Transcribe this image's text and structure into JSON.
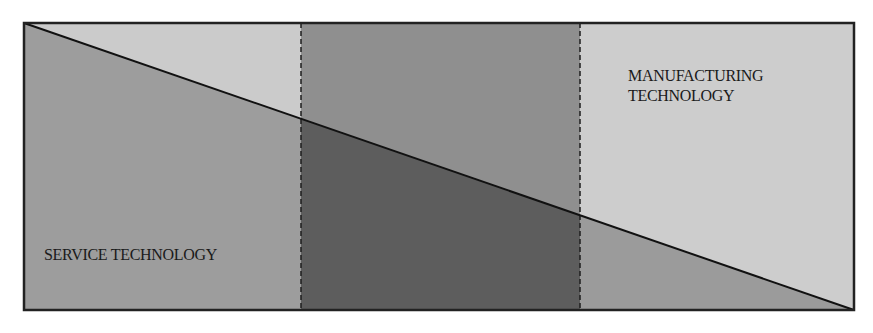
{
  "diagram": {
    "box": {
      "x1": 24,
      "y1": 23,
      "x2": 854,
      "y2": 310
    },
    "dividers_x": [
      301,
      580
    ],
    "diagonal": {
      "from": [
        24,
        23
      ],
      "to": [
        854,
        310
      ]
    },
    "colors": {
      "left_top": "#cbcbcb",
      "left_bottom": "#9d9d9d",
      "middle_top": "#8f8f8f",
      "middle_bottom": "#5d5d5d",
      "right_top": "#cdcdcd",
      "right_bottom": "#9b9b9b",
      "border": "#222222",
      "divider": "#1e1e1e"
    },
    "labels": {
      "manufacturing": [
        "MANUFACTURING",
        "TECHNOLOGY"
      ],
      "service": "SERVICE TECHNOLOGY"
    }
  }
}
